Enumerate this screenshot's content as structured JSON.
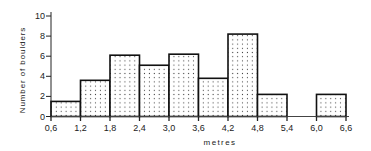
{
  "chart_data": {
    "type": "bar",
    "subtype": "histogram",
    "title": "",
    "xlabel": "metres",
    "ylabel": "Number of boulders",
    "x_ticks": [
      "0,6",
      "1,2",
      "1,8",
      "2,4",
      "3,0",
      "3,6",
      "4,2",
      "4,8",
      "5,4",
      "6,0",
      "6,6"
    ],
    "y_ticks": [
      "0",
      "2",
      "4",
      "6",
      "8",
      "10"
    ],
    "xlim": [
      0.6,
      6.6
    ],
    "ylim": [
      0,
      10
    ],
    "grid": false,
    "legend": null,
    "bins": [
      {
        "from": 0.6,
        "to": 1.2,
        "value": 1.5
      },
      {
        "from": 1.2,
        "to": 1.8,
        "value": 3.6
      },
      {
        "from": 1.8,
        "to": 2.4,
        "value": 6.1
      },
      {
        "from": 2.4,
        "to": 3.0,
        "value": 5.1
      },
      {
        "from": 3.0,
        "to": 3.6,
        "value": 6.2
      },
      {
        "from": 3.6,
        "to": 4.2,
        "value": 3.8
      },
      {
        "from": 4.2,
        "to": 4.8,
        "value": 8.2
      },
      {
        "from": 4.8,
        "to": 5.4,
        "value": 2.2
      },
      {
        "from": 5.4,
        "to": 6.0,
        "value": 0
      },
      {
        "from": 6.0,
        "to": 6.6,
        "value": 2.2
      }
    ],
    "categories": [
      "0.6-1.2",
      "1.2-1.8",
      "1.8-2.4",
      "2.4-3.0",
      "3.0-3.6",
      "3.6-4.2",
      "4.2-4.8",
      "4.8-5.4",
      "5.4-6.0",
      "6.0-6.6"
    ],
    "values": [
      1.5,
      3.6,
      6.1,
      5.1,
      6.2,
      3.8,
      8.2,
      2.2,
      0,
      2.2
    ],
    "fill_pattern": "stippled dots",
    "bar_outline_color": "#111111"
  }
}
